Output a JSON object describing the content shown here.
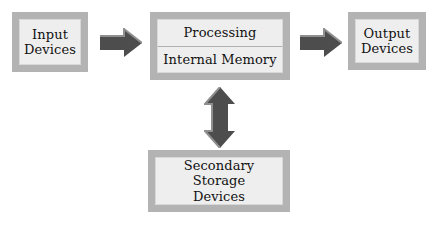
{
  "diagram": {
    "background_color": "#ffffff",
    "box_frame_color": "#b3b3b3",
    "box_fill_color": "#eeeeee",
    "arrow_color": "#4d4d4d",
    "arrow_highlight_color": "#8a8a8a",
    "text_color": "#111111",
    "nodes": {
      "input": {
        "label": "Input\nDevices"
      },
      "processing": {
        "label": "Processing"
      },
      "internal_memory": {
        "label": "Internal Memory"
      },
      "output": {
        "label": "Output\nDevices"
      },
      "secondary_storage": {
        "label": "Secondary\nStorage\nDevices"
      }
    },
    "arrows": {
      "input_to_processing": {
        "direction": "right",
        "name": "input-to-processing"
      },
      "processing_to_output": {
        "direction": "right",
        "name": "processing-to-output"
      },
      "processing_to_storage": {
        "direction": "up-down",
        "name": "processing-to-secondary-storage"
      }
    }
  }
}
